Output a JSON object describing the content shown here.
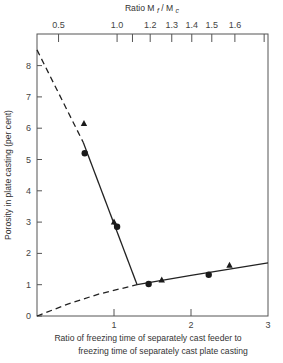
{
  "chart_data": {
    "type": "scatter",
    "title": "",
    "xlabel": "Ratio of freezing time of separately cast feeder to freezing time of separately cast plate casting",
    "xlabel_lines": [
      "Ratio of freezing time of separately cast feeder to",
      "freezing time of separately cast plate casting"
    ],
    "ylabel": "Porosity in plate casting (per cent)",
    "top_axis_label": "Ratio M",
    "top_axis_label_sub1": "f",
    "top_axis_label_sep": " / M",
    "top_axis_label_sub2": "c",
    "xlim": [
      0,
      3
    ],
    "ylim": [
      0,
      9
    ],
    "grid": false,
    "x_ticks": [
      0,
      1,
      2,
      3
    ],
    "y_ticks": [
      0,
      1,
      2,
      3,
      4,
      5,
      6,
      7,
      8
    ],
    "top_ticks": [
      {
        "label": "0.5",
        "x": 0.28
      },
      {
        "label": "1.0",
        "x": 1.04
      },
      {
        "label": "",
        "x": 1.24
      },
      {
        "label": "1.2",
        "x": 1.47
      },
      {
        "label": "1.3",
        "x": 1.75
      },
      {
        "label": "1.4",
        "x": 2.01
      },
      {
        "label": "1.5",
        "x": 2.27
      },
      {
        "label": "1.6",
        "x": 2.57
      },
      {
        "label": "",
        "x": 2.95
      }
    ],
    "series": [
      {
        "name": "circles",
        "marker": "circle",
        "points": [
          [
            0.62,
            5.2
          ],
          [
            1.04,
            2.85
          ],
          [
            1.45,
            1.02
          ],
          [
            2.23,
            1.32
          ]
        ]
      },
      {
        "name": "triangles",
        "marker": "triangle",
        "points": [
          [
            0.61,
            6.15
          ],
          [
            1.0,
            3.0
          ],
          [
            1.62,
            1.15
          ],
          [
            2.5,
            1.62
          ]
        ]
      }
    ],
    "lines": [
      {
        "name": "steep-dashed",
        "style": "dashed",
        "points": [
          [
            0,
            8.5
          ],
          [
            0.6,
            5.55
          ]
        ]
      },
      {
        "name": "steep-solid",
        "style": "solid",
        "points": [
          [
            0.6,
            5.55
          ],
          [
            1.3,
            1.0
          ]
        ]
      },
      {
        "name": "shallow-dashed",
        "style": "dashed",
        "points": [
          [
            0,
            0
          ],
          [
            0.4,
            0.38
          ],
          [
            0.8,
            0.7
          ],
          [
            1.3,
            1.0
          ]
        ]
      },
      {
        "name": "shallow-solid",
        "style": "solid",
        "points": [
          [
            1.3,
            1.0
          ],
          [
            2.0,
            1.3
          ],
          [
            2.5,
            1.5
          ],
          [
            3.0,
            1.7
          ]
        ]
      }
    ]
  }
}
